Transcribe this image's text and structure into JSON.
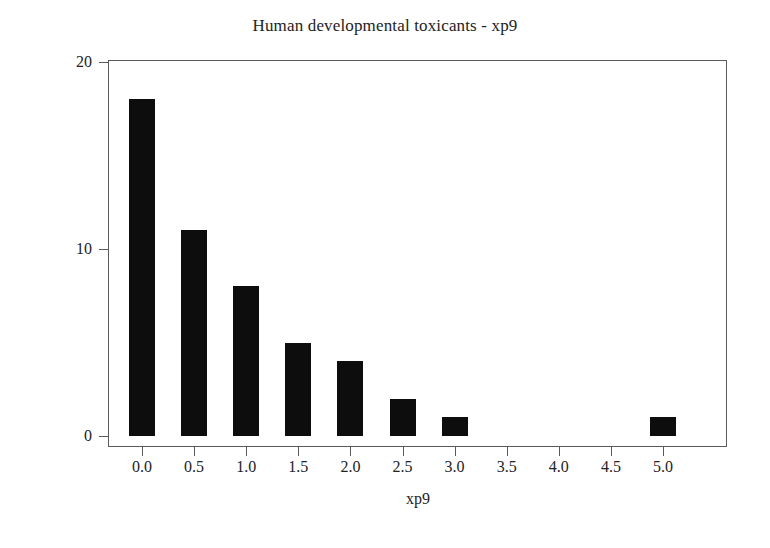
{
  "chart_data": {
    "type": "bar",
    "title": "Human developmental toxicants - xp9",
    "subtitle": "",
    "xlabel": "xp9",
    "ylabel": "Frequency",
    "categories": [
      "0.0",
      "0.5",
      "1.0",
      "1.5",
      "2.0",
      "2.5",
      "3.0",
      "3.5",
      "4.0",
      "4.5",
      "5.0"
    ],
    "values": [
      18,
      11,
      8,
      5,
      4,
      2,
      1,
      0,
      0,
      0,
      1
    ],
    "x_tick_labels": [
      "0.0",
      "0.5",
      "1.0",
      "1.5",
      "2.0",
      "2.5",
      "3.0",
      "3.5",
      "4.0",
      "4.5",
      "5.0"
    ],
    "y_tick_labels": [
      "0",
      "10",
      "20"
    ],
    "y_tick_values": [
      0,
      10,
      20
    ],
    "xlim": [
      -0.3,
      5.3
    ],
    "ylim": [
      0,
      20.7
    ],
    "grid": false,
    "legend": false,
    "legend_position": "none",
    "bar_color": "#0d0d0d",
    "frame_color": "#5a5a5a",
    "background_color": "#ffffff"
  },
  "figure": {
    "title": "Human developmental toxicants - xp9",
    "axis_x_title": "xp9",
    "axis_y_title": "Frequency"
  }
}
